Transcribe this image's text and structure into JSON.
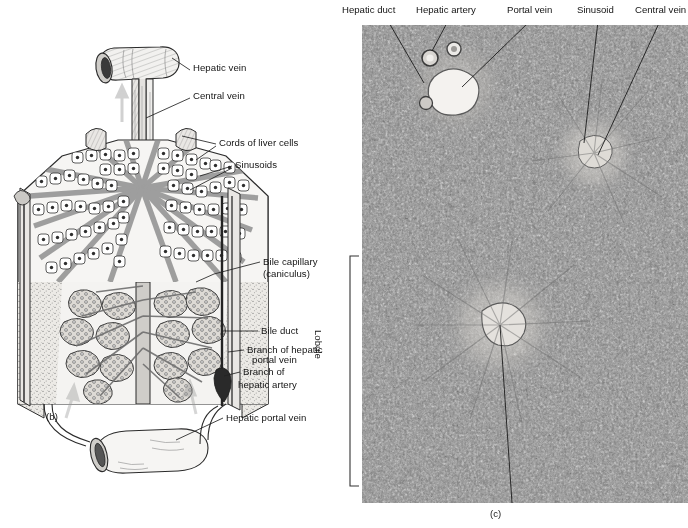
{
  "figure": {
    "background_color": "#ffffff",
    "ink_color": "#141414"
  },
  "panel_b": {
    "caption": "(b)",
    "type": "labeled line drawing",
    "subject": "three-dimensional cut-away diagram of a hepatic lobule",
    "labels": [
      {
        "id": "hepatic-vein",
        "text": "Hepatic vein",
        "x": 193,
        "y": 68
      },
      {
        "id": "central-vein",
        "text": "Central vein",
        "x": 193,
        "y": 96
      },
      {
        "id": "cords-of-liver-cells",
        "text": "Cords of liver cells",
        "x": 219,
        "y": 142
      },
      {
        "id": "sinusoids",
        "text": "Sinusoids",
        "x": 235,
        "y": 164
      },
      {
        "id": "bile-capillary",
        "text": "Bile capillary",
        "x": 263,
        "y": 261
      },
      {
        "id": "canaliculus",
        "text": "(caniculus)",
        "x": 263,
        "y": 273
      },
      {
        "id": "bile-duct",
        "text": "Bile duct",
        "x": 261,
        "y": 330
      },
      {
        "id": "branch-hepatic-portal",
        "text": "Branch of hepatic",
        "x": 247,
        "y": 349
      },
      {
        "id": "branch-hepatic-portal2",
        "text": "portal vein",
        "x": 252,
        "y": 359
      },
      {
        "id": "branch-of",
        "text": "Branch of",
        "x": 243,
        "y": 370
      },
      {
        "id": "hepatic-artery",
        "text": "hepatic artery",
        "x": 238,
        "y": 383
      },
      {
        "id": "hepatic-portal-vein",
        "text": "Hepatic portal vein",
        "x": 226,
        "y": 417
      }
    ]
  },
  "panel_c": {
    "caption": "(c)",
    "type": "light micrograph",
    "subject": "photomicrograph of liver tissue showing a lobule",
    "bracket_label": "Lobule",
    "top_labels": [
      {
        "id": "hepatic-duct",
        "text": "Hepatic duct",
        "x": 2,
        "pointer_x": 48
      },
      {
        "id": "hepatic-artery",
        "text": "Hepatic artery",
        "x": 76,
        "pointer_x": 108
      },
      {
        "id": "portal-vein",
        "text": "Portal vein",
        "x": 167,
        "pointer_x": 190
      },
      {
        "id": "sinusoid",
        "text": "Sinusoid",
        "x": 237,
        "pointer_x": 258
      },
      {
        "id": "central-vein",
        "text": "Central vein",
        "x": 295,
        "pointer_x": 320
      }
    ]
  }
}
